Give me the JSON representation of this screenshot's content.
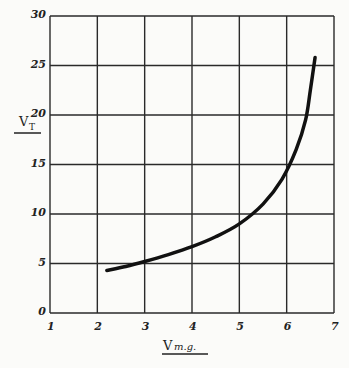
{
  "chart_data": {
    "type": "line",
    "title": "",
    "xlabel": "V_m.g.",
    "ylabel": "V_T",
    "xlim": [
      1,
      7
    ],
    "ylim": [
      0,
      30
    ],
    "grid": true,
    "x_ticks": [
      "1",
      "2",
      "3",
      "4",
      "5",
      "6",
      "7"
    ],
    "y_ticks": [
      "0",
      "5",
      "10",
      "15",
      "20",
      "25",
      "30"
    ],
    "series": [
      {
        "name": "V_T vs V_m.g.",
        "x": [
          2.2,
          2.6,
          3.0,
          3.5,
          4.0,
          4.5,
          5.0,
          5.5,
          5.9,
          6.2,
          6.4,
          6.5,
          6.6
        ],
        "y": [
          4.3,
          4.7,
          5.2,
          5.9,
          6.7,
          7.7,
          9.0,
          11.0,
          13.5,
          16.5,
          19.5,
          22.5,
          25.8
        ]
      }
    ]
  }
}
